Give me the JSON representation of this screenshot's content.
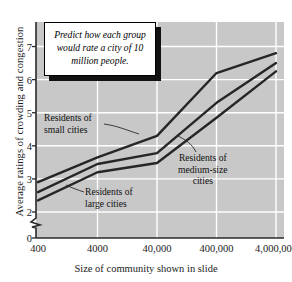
{
  "chart_data": {
    "type": "line",
    "title": "",
    "xlabel": "Size of community shown in slide",
    "ylabel": "Average ratings of crowding and congestion",
    "x": [
      "400",
      "4000",
      "40,000",
      "400,000",
      "4,000,000"
    ],
    "xticklabels": [
      "400",
      "4000",
      "40,000",
      "400,000",
      "4,000,000"
    ],
    "yticklabels": [
      "0",
      "2",
      "3",
      "4",
      "5",
      "6",
      "7"
    ],
    "ytickvalues": [
      0,
      2,
      3,
      4,
      5,
      6,
      7
    ],
    "ylim": [
      2,
      7.5
    ],
    "y_axis_break": true,
    "grid": true,
    "grid_color": "#ffffff",
    "plot_background": "#c8c8c8",
    "line_color": "#262626",
    "legend_position": "inline-annotations",
    "series": [
      {
        "name": "Residents of small cities",
        "values": [
          2.9,
          3.65,
          4.3,
          6.2,
          6.8
        ]
      },
      {
        "name": "Residents of medium-size cities",
        "values": [
          2.6,
          3.45,
          3.78,
          5.3,
          6.5
        ]
      },
      {
        "name": "Residents of large cities",
        "values": [
          2.35,
          3.2,
          3.48,
          4.85,
          6.25
        ]
      }
    ]
  },
  "callout": {
    "text": "Predict how each group would rate a city of 10 million people."
  },
  "annotations": [
    {
      "key": "small",
      "text": "Residents of\nsmall cities"
    },
    {
      "key": "medium",
      "text": "Residents of\nmedium-size\ncities"
    },
    {
      "key": "large",
      "text": "Residents of\nlarge cities"
    }
  ]
}
